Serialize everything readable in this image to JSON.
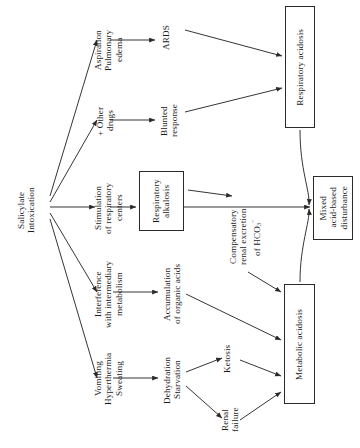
{
  "figure": {
    "type": "flowchart",
    "orientation": "rotated-90-ccw",
    "background": "#ffffff",
    "line_color": "#2a2a2a",
    "text_color": "#1a1a1a"
  },
  "nodes": {
    "source": {
      "id": "salicylate-intoxication",
      "lines": [
        "Salicylate",
        "Intoxication"
      ],
      "boxed": false
    },
    "aspiration": {
      "id": "aspiration-pulmonary-edema",
      "lines": [
        "Aspiration",
        "Pulmonary",
        "edema"
      ],
      "boxed": false
    },
    "other_drugs": {
      "id": "other-drugs",
      "lines": [
        "+ Other",
        "drugs"
      ],
      "boxed": false
    },
    "stimulation": {
      "id": "stimulation-respiratory-centers",
      "lines": [
        "Stimulation",
        "of respiratory",
        "centers"
      ],
      "boxed": false
    },
    "interference": {
      "id": "interference-intermediary-metabolism",
      "lines": [
        "Interference",
        "with intermediary",
        "metabolism"
      ],
      "boxed": false
    },
    "vomiting": {
      "id": "vomiting-hyperthermia-sweating",
      "lines": [
        "Vomiting",
        "Hyperthermia",
        "Sweating"
      ],
      "boxed": false
    },
    "ards": {
      "id": "ards",
      "lines": [
        "ARDS"
      ],
      "boxed": false
    },
    "blunted": {
      "id": "blunted-response",
      "lines": [
        "Blunted",
        "response"
      ],
      "boxed": false
    },
    "resp_alkalosis": {
      "id": "respiratory-alkalosis",
      "lines": [
        "Respiratory",
        "alkalosis"
      ],
      "boxed": true
    },
    "accumulation": {
      "id": "accumulation-organic-acids",
      "lines": [
        "Accumulation",
        "of organic acids"
      ],
      "boxed": false
    },
    "dehydration": {
      "id": "dehydration-starvation",
      "lines": [
        "Dehydration",
        "Starvation"
      ],
      "boxed": false
    },
    "compensatory": {
      "id": "compensatory-renal-excretion-hco3",
      "lines": [
        "Compensatory",
        "renal excretion",
        "of HCO3-"
      ],
      "boxed": false
    },
    "ketosis": {
      "id": "ketosis",
      "lines": [
        "Ketosis"
      ],
      "boxed": false
    },
    "renal_failure": {
      "id": "renal-failure",
      "lines": [
        "Renal",
        "failure"
      ],
      "boxed": false
    },
    "resp_acidosis": {
      "id": "respiratory-acidosis",
      "lines": [
        "Respiratory acidosis"
      ],
      "boxed": true
    },
    "mixed": {
      "id": "mixed-acid-based-disturbance",
      "lines": [
        "Mixed",
        "acid-based",
        "disturbance"
      ],
      "boxed": true
    },
    "metabolic_acidosis": {
      "id": "metabolic-acidosis",
      "lines": [
        "Metabolic acidosis"
      ],
      "boxed": true
    }
  },
  "edges": [
    {
      "from": "salicylate-intoxication",
      "to": "aspiration-pulmonary-edema"
    },
    {
      "from": "salicylate-intoxication",
      "to": "other-drugs"
    },
    {
      "from": "salicylate-intoxication",
      "to": "stimulation-respiratory-centers"
    },
    {
      "from": "salicylate-intoxication",
      "to": "interference-intermediary-metabolism"
    },
    {
      "from": "salicylate-intoxication",
      "to": "vomiting-hyperthermia-sweating"
    },
    {
      "from": "aspiration-pulmonary-edema",
      "to": "ards"
    },
    {
      "from": "other-drugs",
      "to": "blunted-response"
    },
    {
      "from": "stimulation-respiratory-centers",
      "to": "respiratory-alkalosis"
    },
    {
      "from": "interference-intermediary-metabolism",
      "to": "accumulation-organic-acids"
    },
    {
      "from": "vomiting-hyperthermia-sweating",
      "to": "dehydration-starvation"
    },
    {
      "from": "ards",
      "to": "respiratory-acidosis"
    },
    {
      "from": "blunted-response",
      "to": "respiratory-acidosis"
    },
    {
      "from": "respiratory-alkalosis",
      "to": "mixed-acid-based-disturbance"
    },
    {
      "from": "respiratory-alkalosis",
      "to": "compensatory-renal-excretion-hco3"
    },
    {
      "from": "compensatory-renal-excretion-hco3",
      "to": "metabolic-acidosis"
    },
    {
      "from": "accumulation-organic-acids",
      "to": "metabolic-acidosis"
    },
    {
      "from": "dehydration-starvation",
      "to": "ketosis"
    },
    {
      "from": "dehydration-starvation",
      "to": "renal-failure"
    },
    {
      "from": "ketosis",
      "to": "metabolic-acidosis"
    },
    {
      "from": "renal-failure",
      "to": "metabolic-acidosis"
    },
    {
      "from": "respiratory-acidosis",
      "to": "mixed-acid-based-disturbance",
      "style": "curved"
    },
    {
      "from": "metabolic-acidosis",
      "to": "mixed-acid-based-disturbance",
      "style": "curved"
    }
  ]
}
